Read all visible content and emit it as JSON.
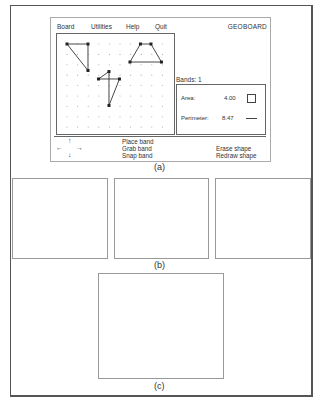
{
  "app": {
    "title": "GEOBOARD",
    "menu": [
      {
        "label": "Board"
      },
      {
        "label": "Utilities"
      },
      {
        "label": "Help"
      },
      {
        "label": "Quit"
      }
    ]
  },
  "board": {
    "grid": {
      "cols": 10,
      "rows": 9
    },
    "shapes": [
      {
        "name": "triangle",
        "vertices": [
          [
            0,
            0
          ],
          [
            2,
            0
          ],
          [
            2,
            2.5
          ]
        ]
      },
      {
        "name": "trapezoid",
        "vertices": [
          [
            7,
            0
          ],
          [
            8,
            0
          ],
          [
            9,
            1.7
          ],
          [
            6,
            1.7
          ]
        ]
      },
      {
        "name": "kite",
        "vertices": [
          [
            4,
            2.6
          ],
          [
            3,
            3.3
          ],
          [
            5,
            3.3
          ],
          [
            4,
            5.8
          ]
        ]
      }
    ]
  },
  "measurements": {
    "bands_label": "Bands: 1",
    "area_label": "Area:",
    "area_value": "4.00",
    "perimeter_label": "Perimeter:",
    "perimeter_value": "8.47"
  },
  "controls": {
    "arrows": {
      "up": "↑",
      "left": "←",
      "right": "→",
      "down": "↓"
    },
    "commands_left": [
      "Place band",
      "Grab band",
      "Snap band"
    ],
    "commands_right": [
      "Erase shape",
      "Redraw shape"
    ]
  },
  "captions": {
    "a": "(a)",
    "b": "(b)",
    "c": "(c)"
  },
  "boards_b": [
    {
      "name": "triangular-grid-coarse",
      "rows": 5,
      "cols": 5
    },
    {
      "name": "triangular-grid-medium",
      "rows": 10,
      "cols": 10
    },
    {
      "name": "triangular-grid-fine",
      "rows": 12,
      "cols": 16
    }
  ],
  "board_c": {
    "name": "circular-geoboard",
    "pegs_on_circle": 24,
    "center_peg": true
  }
}
